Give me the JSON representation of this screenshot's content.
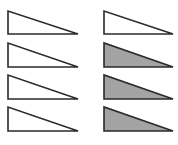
{
  "figure": {
    "stroke_color": "#2a2a2a",
    "shaded_fill": "#a3a3a3",
    "unshaded_fill": "#ffffff",
    "columns": [
      {
        "name": "left",
        "triangles": [
          {
            "row": 1,
            "shaded": false
          },
          {
            "row": 2,
            "shaded": false
          },
          {
            "row": 3,
            "shaded": false
          },
          {
            "row": 4,
            "shaded": false
          }
        ]
      },
      {
        "name": "right",
        "triangles": [
          {
            "row": 1,
            "shaded": false
          },
          {
            "row": 2,
            "shaded": true
          },
          {
            "row": 3,
            "shaded": true
          },
          {
            "row": 4,
            "shaded": true
          }
        ]
      }
    ]
  }
}
